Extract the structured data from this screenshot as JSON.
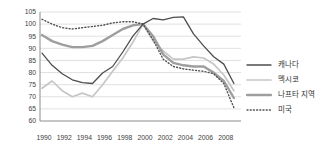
{
  "chart_data": {
    "type": "line",
    "title": "",
    "x": [
      1990,
      1991,
      1992,
      1993,
      1994,
      1995,
      1996,
      1997,
      1998,
      1999,
      2000,
      2001,
      2002,
      2003,
      2004,
      2005,
      2006,
      2007,
      2008,
      2009
    ],
    "x_tick_labels": [
      "1990",
      "1992",
      "1994",
      "1996",
      "1998",
      "2000",
      "2002",
      "2004",
      "2006",
      "2008"
    ],
    "y_tick_labels": [
      "105",
      "100",
      "95",
      "90",
      "85",
      "80",
      "75",
      "70",
      "65",
      "60"
    ],
    "y_ticks": [
      105,
      100,
      95,
      90,
      85,
      80,
      75,
      70,
      65,
      60
    ],
    "ylim": [
      60,
      105
    ],
    "grid": "horizontal",
    "legend_position": "right",
    "index_note": "2000 = 100",
    "series": [
      {
        "id": "canada",
        "label": "캐나다",
        "color": "#4d4d4d",
        "width": 1.3,
        "dash": null,
        "values": [
          88,
          83,
          79.5,
          77,
          75.8,
          75.5,
          79.8,
          82.5,
          88.5,
          95,
          100,
          102.3,
          101.8,
          102.8,
          103,
          96,
          91,
          86.5,
          83.5,
          75.5
        ]
      },
      {
        "id": "mexico",
        "label": "멕시코",
        "color": "#c6c6c6",
        "width": 1.7,
        "dash": null,
        "values": [
          73.5,
          76.5,
          72.5,
          70,
          71.5,
          70,
          75,
          80.5,
          86,
          92.5,
          100,
          93,
          89,
          85.5,
          85.5,
          86.5,
          86,
          83.5,
          79,
          72.5
        ]
      },
      {
        "id": "nafta",
        "label": "나프타 지역",
        "color": "#9e9e9e",
        "width": 2.4,
        "dash": null,
        "values": [
          95.5,
          93,
          91.5,
          90.5,
          90.5,
          91,
          93,
          95.5,
          98,
          99.5,
          100,
          95,
          87.5,
          84,
          83,
          82.5,
          82.5,
          80,
          76.5,
          69.5
        ]
      },
      {
        "id": "usa",
        "label": "미국",
        "color": "#515151",
        "width": 1.4,
        "dash": "1 2.2",
        "values": [
          102,
          100,
          98.5,
          98,
          98.5,
          99,
          99.5,
          100.5,
          101,
          101,
          100,
          93.5,
          85.5,
          82.5,
          81.5,
          81,
          80.5,
          79.5,
          75.5,
          65.5
        ]
      }
    ]
  },
  "colors": {
    "background": "#ffffff",
    "gridline": "#d9d9d9",
    "spine": "#8c8c8c",
    "tick_text": "#404040",
    "legend_text": "#333333"
  }
}
